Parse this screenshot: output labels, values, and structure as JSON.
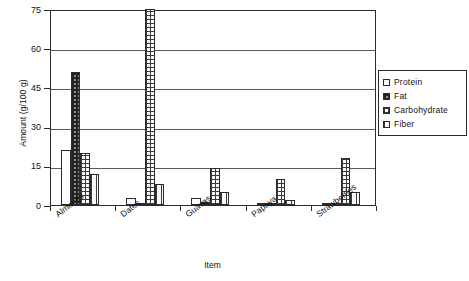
{
  "chart_data": {
    "type": "bar",
    "title": "",
    "xlabel": "Item",
    "ylabel": "Amount (g/100 g)",
    "categories": [
      "Almonds",
      "Dates",
      "Guavas",
      "Papaya",
      "Strawberries"
    ],
    "series": [
      {
        "name": "Protein",
        "pattern": "light-dotted",
        "values": [
          21,
          2.5,
          2.5,
          0.6,
          0.7
        ]
      },
      {
        "name": "Fat",
        "pattern": "dark-dotted",
        "values": [
          51,
          0.4,
          1,
          0.1,
          0.3
        ]
      },
      {
        "name": "Carbohydrate",
        "pattern": "cross-hatch",
        "values": [
          20,
          75,
          14,
          10,
          18
        ]
      },
      {
        "name": "Fiber",
        "pattern": "vertical-lines",
        "values": [
          12,
          8,
          5,
          2,
          5
        ]
      }
    ],
    "ylim": [
      0,
      75
    ],
    "yticks": [
      0,
      15,
      30,
      45,
      60,
      75
    ],
    "grid": true,
    "legend_position": "right"
  },
  "legend": {
    "items": [
      {
        "label": "Protein"
      },
      {
        "label": "Fat"
      },
      {
        "label": "Carbohydrate"
      },
      {
        "label": "Fiber"
      }
    ]
  }
}
